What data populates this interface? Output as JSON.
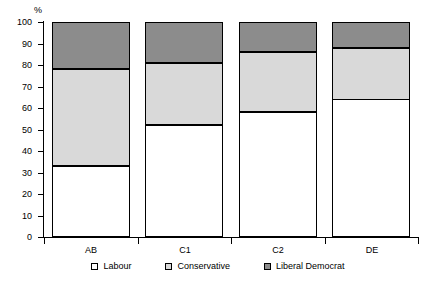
{
  "chart_data": {
    "type": "bar",
    "subtype": "stacked-bar-100",
    "title": "",
    "xlabel": "",
    "ylabel": "%",
    "ylim": [
      0,
      100
    ],
    "yticks": [
      0,
      10,
      20,
      30,
      40,
      50,
      60,
      70,
      80,
      90,
      100
    ],
    "ytick_labels": [
      "0",
      "10",
      "20",
      "30",
      "40",
      "50",
      "60",
      "70",
      "80",
      "90",
      "100"
    ],
    "grid": false,
    "legend_position": "bottom",
    "categories": [
      "AB",
      "C1",
      "C2",
      "DE"
    ],
    "series": [
      {
        "name": "Labour",
        "color": "#ffffff",
        "values": [
          33,
          52,
          58,
          64
        ]
      },
      {
        "name": "Conservative",
        "color": "#d9d9d9",
        "values": [
          45,
          29,
          28,
          24
        ]
      },
      {
        "name": "Liberal Democrat",
        "color": "#8c8c8c",
        "values": [
          22,
          19,
          14,
          12
        ]
      }
    ],
    "cumulative_boundaries": {
      "AB": [
        33,
        78,
        100
      ],
      "C1": [
        52,
        81,
        100
      ],
      "C2": [
        58,
        86,
        100
      ],
      "DE": [
        64,
        88,
        100
      ]
    }
  },
  "axis": {
    "y_unit": "%"
  },
  "legend": {
    "entries": [
      {
        "label": "Labour",
        "swatch": "white-square-icon"
      },
      {
        "label": "Conservative",
        "swatch": "light-grey-square-icon"
      },
      {
        "label": "Liberal Democrat",
        "swatch": "dark-grey-square-icon"
      }
    ]
  },
  "colors": {
    "labour": "#ffffff",
    "conservative": "#d9d9d9",
    "liberal_democrat": "#8c8c8c",
    "outline": "#000000",
    "background": "#ffffff"
  }
}
